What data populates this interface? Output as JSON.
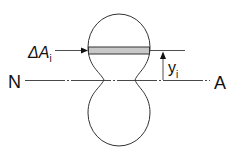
{
  "diagram": {
    "labels": {
      "delta_a": "ΔA",
      "delta_a_sub": "i",
      "y": "y",
      "y_sub": "i",
      "n": "N",
      "a": "A"
    },
    "colors": {
      "stroke": "#333333",
      "strip_fill": "#c8c8c8",
      "text": "#111111"
    }
  }
}
